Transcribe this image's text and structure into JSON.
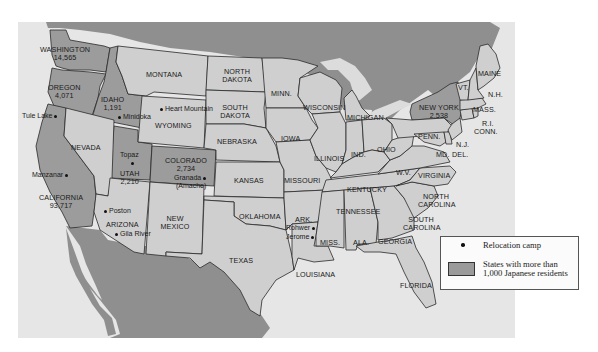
{
  "map": {
    "title": "Japanese American relocation camps",
    "colors": {
      "canada_mexico": "#8f8f8f",
      "ocean": "#e4e4e4",
      "state": "#cfcfcf",
      "state_highlight": "#9c9c9c",
      "border": "#2a2a2a"
    },
    "states": [
      {
        "name": "WASHINGTON",
        "population": "14,565",
        "highlight": true
      },
      {
        "name": "OREGON",
        "population": "4,071",
        "highlight": true
      },
      {
        "name": "IDAHO",
        "population": "1,191",
        "highlight": true
      },
      {
        "name": "CALIFORNIA",
        "population": "93,717",
        "highlight": true
      },
      {
        "name": "UTAH",
        "population": "2,210",
        "highlight": true
      },
      {
        "name": "COLORADO",
        "population": "2,734",
        "highlight": true
      },
      {
        "name": "NEW YORK",
        "population": "2,538",
        "highlight": true
      },
      {
        "name": "MONTANA"
      },
      {
        "name": "WYOMING"
      },
      {
        "name": "NEVADA"
      },
      {
        "name": "ARIZONA"
      },
      {
        "name": "NEW MEXICO"
      },
      {
        "name": "NORTH DAKOTA"
      },
      {
        "name": "SOUTH DAKOTA"
      },
      {
        "name": "NEBRASKA"
      },
      {
        "name": "KANSAS"
      },
      {
        "name": "OKLAHOMA"
      },
      {
        "name": "TEXAS"
      },
      {
        "name": "MINN."
      },
      {
        "name": "IOWA"
      },
      {
        "name": "MISSOURI"
      },
      {
        "name": "ARK."
      },
      {
        "name": "LOUISIANA"
      },
      {
        "name": "WISCONSIN"
      },
      {
        "name": "ILLINOIS"
      },
      {
        "name": "MICHIGAN"
      },
      {
        "name": "IND."
      },
      {
        "name": "OHIO"
      },
      {
        "name": "KENTUCKY"
      },
      {
        "name": "TENNESSEE"
      },
      {
        "name": "MISS."
      },
      {
        "name": "ALA."
      },
      {
        "name": "GEORGIA"
      },
      {
        "name": "FLORIDA"
      },
      {
        "name": "SOUTH CAROLINA"
      },
      {
        "name": "NORTH CAROLINA"
      },
      {
        "name": "VIRGINIA"
      },
      {
        "name": "W.V."
      },
      {
        "name": "PENN."
      },
      {
        "name": "MD."
      },
      {
        "name": "DEL."
      },
      {
        "name": "N.J."
      },
      {
        "name": "CONN."
      },
      {
        "name": "R.I."
      },
      {
        "name": "MASS."
      },
      {
        "name": "VT."
      },
      {
        "name": "N.H."
      },
      {
        "name": "MAINE"
      }
    ],
    "camps": [
      {
        "name": "Tule Lake"
      },
      {
        "name": "Minidoka"
      },
      {
        "name": "Heart Mountain"
      },
      {
        "name": "Manzanar"
      },
      {
        "name": "Topaz"
      },
      {
        "name": "Granada (Amache)",
        "line1": "Granada",
        "line2": "(Amache)"
      },
      {
        "name": "Poston"
      },
      {
        "name": "Gila River"
      },
      {
        "name": "Rohwer"
      },
      {
        "name": "Jerome"
      }
    ]
  },
  "legend": {
    "items": [
      {
        "symbol": "dot",
        "label": "Relocation camp"
      },
      {
        "symbol": "swatch",
        "label_line1": "States with more than",
        "label_line2": "1,000 Japanese residents"
      }
    ]
  }
}
